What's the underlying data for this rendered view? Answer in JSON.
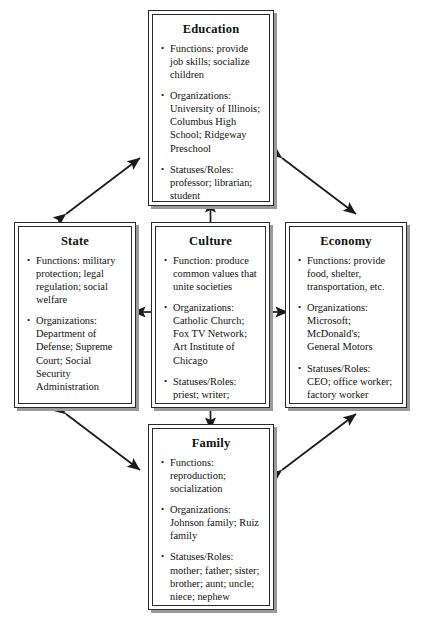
{
  "diagram": {
    "nodes": {
      "education": {
        "title": "Education",
        "bullets": [
          "Functions: provide job skills; socialize children",
          "Organizations: University of Illinois; Columbus High School; Ridgeway Preschool",
          "Statuses/Roles: professor; librarian; student"
        ]
      },
      "state": {
        "title": "State",
        "bullets": [
          "Functions: military protection; legal regulation; social welfare",
          "Organizations: Department of Defense; Supreme Court; Social Security Administration",
          "Statuses/Roles: sergeant; justice; case worker"
        ]
      },
      "culture": {
        "title": "Culture",
        "bullets": [
          "Function: produce common values that unite societies",
          "Organizations: Catholic Church; Fox TV Network;  Art Institute of Chicago",
          "Statuses/Roles: priest; writer; curator; artist"
        ]
      },
      "economy": {
        "title": "Economy",
        "bullets": [
          "Functions: provide food, shelter, transportation, etc.",
          "Organizations: Microsoft; McDonald's; General Motors",
          "Statuses/Roles: CEO; office worker; factory worker"
        ]
      },
      "family": {
        "title": "Family",
        "bullets": [
          "Functions: reproduction; socialization",
          "Organizations: Johnson family; Ruiz family",
          "Statuses/Roles: mother; father; sister; brother; aunt; uncle; niece; nephew"
        ]
      }
    },
    "connectors": [
      {
        "name": "culture-to-education",
        "from": "culture",
        "to": "education",
        "style": "single-arrow",
        "direction": "up"
      },
      {
        "name": "culture-to-family",
        "from": "culture",
        "to": "family",
        "style": "single-arrow",
        "direction": "down"
      },
      {
        "name": "culture-to-state",
        "from": "culture",
        "to": "state",
        "style": "single-arrow",
        "direction": "left"
      },
      {
        "name": "culture-to-economy",
        "from": "culture",
        "to": "economy",
        "style": "single-arrow",
        "direction": "right"
      },
      {
        "name": "state-to-education",
        "from": "state",
        "to": "education",
        "style": "double-arrow",
        "direction": "diagonal"
      },
      {
        "name": "education-to-economy",
        "from": "education",
        "to": "economy",
        "style": "double-arrow",
        "direction": "diagonal"
      },
      {
        "name": "state-to-family",
        "from": "state",
        "to": "family",
        "style": "double-arrow",
        "direction": "diagonal"
      },
      {
        "name": "family-to-economy",
        "from": "family",
        "to": "economy",
        "style": "double-arrow",
        "direction": "diagonal"
      }
    ],
    "colors": {
      "line": "#1a1a1a",
      "border": "#2a2a2a",
      "shadow": "#9a9a9a",
      "background": "#ffffff"
    }
  }
}
